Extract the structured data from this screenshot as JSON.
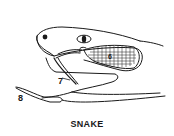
{
  "figure": {
    "caption": "SNAKE",
    "colors": {
      "ink": "#1a1a1a",
      "background": "#ffffff"
    },
    "labels": [
      {
        "id": "6",
        "text": "6",
        "target": "venom gland"
      },
      {
        "id": "7",
        "text": "7",
        "target": "fang"
      },
      {
        "id": "8",
        "text": "8",
        "target": "forked tongue"
      }
    ]
  }
}
